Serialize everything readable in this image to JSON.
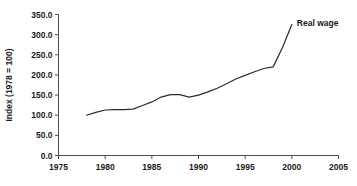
{
  "chart_data": {
    "type": "line",
    "title": "",
    "xlabel": "",
    "ylabel": "Index (1978 = 100)",
    "xlim": [
      1975,
      2005
    ],
    "ylim": [
      0,
      350
    ],
    "grid": false,
    "legend_position": "inline-annotation-top-right",
    "x_ticks": [
      "1975",
      "1980",
      "1985",
      "1990",
      "1995",
      "2000",
      "2005"
    ],
    "x_tick_values": [
      1975,
      1980,
      1985,
      1990,
      1995,
      2000,
      2005
    ],
    "y_ticks": [
      "0.0",
      "50.0",
      "100.0",
      "150.0",
      "200.0",
      "250.0",
      "300.0",
      "350.0"
    ],
    "y_tick_values": [
      0,
      50,
      100,
      150,
      200,
      250,
      300,
      350
    ],
    "series": [
      {
        "name": "Real wage",
        "color": "#2b2b2b",
        "x": [
          1978,
          1979,
          1980,
          1981,
          1982,
          1983,
          1984,
          1985,
          1986,
          1987,
          1988,
          1989,
          1990,
          1991,
          1992,
          1993,
          1994,
          1995,
          1996,
          1997,
          1998,
          1999,
          2000
        ],
        "values": [
          100,
          107,
          113,
          114,
          114,
          115,
          124,
          133,
          145,
          151,
          151,
          145,
          150,
          158,
          167,
          178,
          190,
          199,
          208,
          216,
          220,
          268,
          325
        ]
      }
    ],
    "annotations": [
      {
        "text": "Real wage",
        "x": 2000,
        "y": 330,
        "anchor": "start"
      }
    ]
  },
  "axis": {
    "y_title": "Index (1978 = 100)"
  }
}
